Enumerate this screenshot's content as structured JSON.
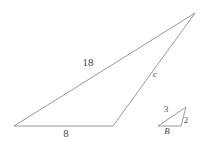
{
  "figure": {
    "kind": "geometry-diagram",
    "stroke_color": "#8c8c8c",
    "label_color": "#4a4a4a",
    "background_color": "#ffffff",
    "large_triangle": {
      "name": "large-triangle",
      "vertices": [
        {
          "name": "left-vertex",
          "x": 14,
          "y": 126
        },
        {
          "name": "bottom-right-vertex",
          "x": 113,
          "y": 126
        },
        {
          "name": "apex-vertex",
          "x": 195,
          "y": 13
        }
      ],
      "labels": [
        {
          "name": "side-label-18",
          "text": "18",
          "x": 88,
          "y": 62
        },
        {
          "name": "side-label-8",
          "text": "8",
          "x": 66,
          "y": 133
        },
        {
          "name": "side-label-c",
          "text": "c",
          "x": 155,
          "y": 74
        }
      ]
    },
    "small_triangle": {
      "name": "small-triangle",
      "vertices": [
        {
          "name": "left-vertex",
          "x": 158,
          "y": 126
        },
        {
          "name": "bottom-right-vertex",
          "x": 181,
          "y": 126
        },
        {
          "name": "apex-vertex",
          "x": 186,
          "y": 107
        }
      ],
      "labels": [
        {
          "name": "side-label-3",
          "text": "3",
          "x": 166,
          "y": 109
        },
        {
          "name": "side-label-2",
          "text": "2",
          "x": 186,
          "y": 120
        },
        {
          "name": "vertex-label-B",
          "text": "B",
          "x": 167,
          "y": 131
        }
      ]
    }
  }
}
